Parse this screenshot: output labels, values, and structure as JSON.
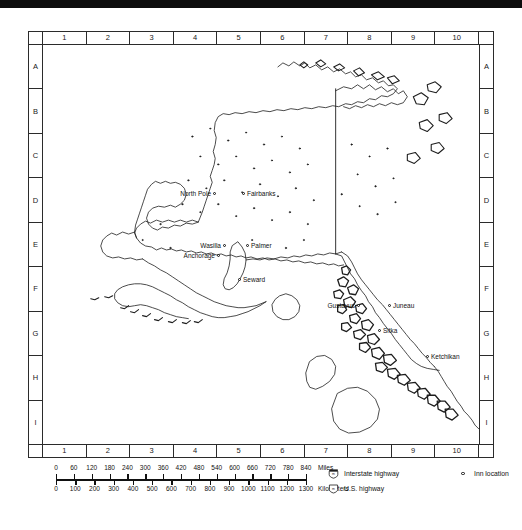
{
  "map": {
    "title": "Alaska reference map",
    "columns": [
      "1",
      "2",
      "3",
      "4",
      "5",
      "6",
      "7",
      "8",
      "9",
      "10"
    ],
    "rows": [
      "A",
      "B",
      "C",
      "D",
      "E",
      "F",
      "G",
      "H",
      "I"
    ],
    "cities": [
      {
        "name": "North Pole",
        "x": 168,
        "y": 148,
        "align": "right",
        "dot": true
      },
      {
        "name": "Fairbanks",
        "x": 204,
        "y": 148,
        "align": "left",
        "dot": true
      },
      {
        "name": "Wasilla",
        "x": 178,
        "y": 200,
        "align": "right",
        "dot": true
      },
      {
        "name": "Palmer",
        "x": 208,
        "y": 200,
        "align": "left",
        "dot": true
      },
      {
        "name": "Anchorage",
        "x": 172,
        "y": 210,
        "align": "right",
        "dot": true
      },
      {
        "name": "Seward",
        "x": 200,
        "y": 234,
        "align": "left",
        "dot": true
      },
      {
        "name": "Gustavus",
        "x": 312,
        "y": 260,
        "align": "right",
        "dot": true
      },
      {
        "name": "Juneau",
        "x": 350,
        "y": 260,
        "align": "left",
        "dot": true
      },
      {
        "name": "Sitka",
        "x": 340,
        "y": 285,
        "align": "left",
        "dot": true
      },
      {
        "name": "Ketchikan",
        "x": 388,
        "y": 311,
        "align": "left",
        "dot": true
      }
    ]
  },
  "scale": {
    "miles_label": "Miles",
    "kilometers_label": "Kilometers",
    "miles_ticks": [
      "0",
      "60",
      "120",
      "180",
      "240",
      "300",
      "360",
      "420",
      "480",
      "540",
      "600",
      "660",
      "720",
      "780",
      "840"
    ],
    "km_ticks": [
      "0",
      "100",
      "200",
      "300",
      "400",
      "500",
      "600",
      "700",
      "800",
      "900",
      "1000",
      "1100",
      "1200",
      "1300"
    ]
  },
  "legend": {
    "interstate_label": "Interstate highway",
    "us_highway_label": "U.S. highway",
    "inn_label": "Inn location",
    "interstate_icon": "interstate-shield-icon",
    "us_highway_icon": "us-route-shield-icon",
    "inn_icon": "inn-circle-icon"
  },
  "colors": {
    "ink": "#1a1a1a",
    "frame": "#2b2b2b",
    "paper": "#ffffff"
  }
}
